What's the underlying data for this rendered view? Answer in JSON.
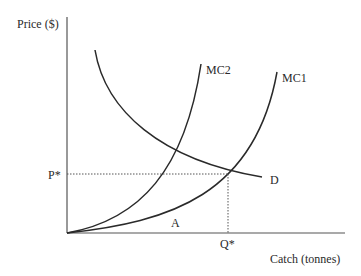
{
  "diagram": {
    "y_axis_label": "Price ($)",
    "x_axis_label": "Catch (tonnes)",
    "curves": [
      {
        "name": "D",
        "label": "D",
        "kind": "demand"
      },
      {
        "name": "MC1",
        "label": "MC1",
        "kind": "marginal-cost"
      },
      {
        "name": "MC2",
        "label": "MC2",
        "kind": "marginal-cost"
      }
    ],
    "equilibrium": {
      "price_label": "P*",
      "quantity_label": "Q*"
    },
    "area_label": "A",
    "colors": {
      "line": "#2a2a2a",
      "axis": "#555555",
      "background": "#ffffff"
    }
  }
}
